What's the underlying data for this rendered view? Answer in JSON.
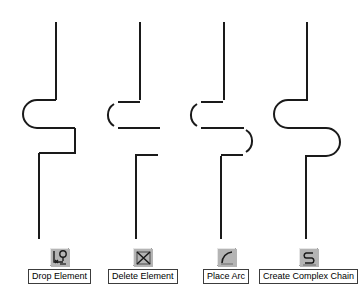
{
  "canvas": {
    "width": 363,
    "height": 303,
    "background": "#ffffff",
    "stroke_color": "#1a1a1a"
  },
  "diagram": {
    "title": "",
    "stroke_width": 2,
    "shapes": [
      {
        "id": "shape-drop-element",
        "name": "chain-sharp-corners",
        "note": "Continuous polyline: vertical down, rounded left bend, horizontal, square step, vertical down"
      },
      {
        "id": "shape-delete-element",
        "name": "chain-with-deleted-segments",
        "note": "Broken polyline with missing segments after deletion"
      },
      {
        "id": "shape-place-arc",
        "name": "chain-with-arcs",
        "note": "Polyline with two arc segments placed at the bends"
      },
      {
        "id": "shape-complex-chain",
        "name": "chain-complex-smooth",
        "note": "Fully smooth complex chain with two opposing fillets"
      }
    ]
  },
  "toolbar": {
    "items": [
      {
        "id": "drop-element",
        "label": "Drop Element",
        "icon": "drop-element-icon",
        "x": 28,
        "icon_x": 46
      },
      {
        "id": "delete-element",
        "label": "Delete Element",
        "icon": "delete-element-icon",
        "x": 108,
        "icon_x": 131
      },
      {
        "id": "place-arc",
        "label": "Place Arc",
        "icon": "place-arc-icon",
        "x": 203,
        "icon_x": 215
      },
      {
        "id": "create-complex-chain",
        "label": "Create Complex Chain",
        "icon": "create-complex-chain-icon",
        "x": 259,
        "icon_x": 301
      }
    ],
    "icon_face_color": "#b4b4b4",
    "label_border_color": "#3c3c3c",
    "label_text_color": "#000000"
  }
}
